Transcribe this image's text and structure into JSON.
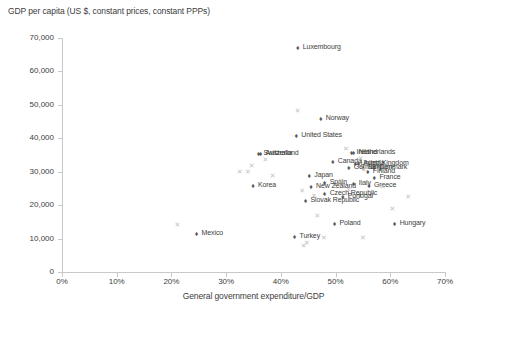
{
  "chart_data": {
    "type": "scatter",
    "title": "GDP per capita (US $, constant prices, constant PPPs)",
    "xlabel": "General government expenditure/GDP",
    "ylabel": "",
    "xlim": [
      0,
      70
    ],
    "ylim": [
      0,
      70000
    ],
    "xticks": [
      "0%",
      "10%",
      "20%",
      "30%",
      "40%",
      "50%",
      "60%",
      "70%"
    ],
    "xtick_values": [
      0,
      10,
      20,
      30,
      40,
      50,
      60,
      70
    ],
    "yticks": [
      "0",
      "10,000",
      "20,000",
      "30,000",
      "40,000",
      "50,000",
      "60,000",
      "70,000"
    ],
    "ytick_values": [
      0,
      10000,
      20000,
      30000,
      40000,
      50000,
      60000,
      70000
    ],
    "grid": false,
    "legend": "none",
    "series": [
      {
        "name": "labelled-countries",
        "marker": "diamond",
        "color": "#58595b",
        "points": [
          {
            "label": "Luxembourg",
            "x": 43.1,
            "y": 67100
          },
          {
            "label": "Norway",
            "x": 47.3,
            "y": 45800
          },
          {
            "label": "United States",
            "x": 42.8,
            "y": 40700
          },
          {
            "label": "Switzerland",
            "x": 35.9,
            "y": 35200
          },
          {
            "label": "Australia",
            "x": 36.3,
            "y": 35200
          },
          {
            "label": "Ireland",
            "x": 52.9,
            "y": 35700
          },
          {
            "label": "Netherlands",
            "x": 53.3,
            "y": 35700
          },
          {
            "label": "Canada",
            "x": 49.5,
            "y": 32800
          },
          {
            "label": "United Kingdom",
            "x": 53.6,
            "y": 32400
          },
          {
            "label": "Austria",
            "x": 54.2,
            "y": 32400
          },
          {
            "label": "Germany",
            "x": 52.4,
            "y": 31100
          },
          {
            "label": "Belgium",
            "x": 55.0,
            "y": 31100
          },
          {
            "label": "Denmark",
            "x": 57.1,
            "y": 31100
          },
          {
            "label": "Finland",
            "x": 55.9,
            "y": 29900
          },
          {
            "label": "France",
            "x": 57.1,
            "y": 28000
          },
          {
            "label": "Japan",
            "x": 45.2,
            "y": 28800
          },
          {
            "label": "Spain",
            "x": 48.0,
            "y": 26700
          },
          {
            "label": "Italy",
            "x": 53.3,
            "y": 26400
          },
          {
            "label": "Greece",
            "x": 56.1,
            "y": 25700
          },
          {
            "label": "New Zealand",
            "x": 45.5,
            "y": 25400
          },
          {
            "label": "Czech Republic",
            "x": 48.0,
            "y": 23400
          },
          {
            "label": "Portugal",
            "x": 51.3,
            "y": 22400
          },
          {
            "label": "Slovak Republic",
            "x": 44.5,
            "y": 21200
          },
          {
            "label": "Poland",
            "x": 49.8,
            "y": 14400
          },
          {
            "label": "Hungary",
            "x": 60.8,
            "y": 14400
          },
          {
            "label": "Korea",
            "x": 34.9,
            "y": 25700
          },
          {
            "label": "Mexico",
            "x": 24.6,
            "y": 11500
          },
          {
            "label": "Turkey",
            "x": 42.5,
            "y": 10600
          }
        ]
      },
      {
        "name": "unlabelled-series",
        "marker": "x",
        "color": "#c2c2c2",
        "points": [
          {
            "x": 43.1,
            "y": 48200
          },
          {
            "x": 37.2,
            "y": 33400
          },
          {
            "x": 34.7,
            "y": 31700
          },
          {
            "x": 32.5,
            "y": 29900
          },
          {
            "x": 34.0,
            "y": 29900
          },
          {
            "x": 38.5,
            "y": 28800
          },
          {
            "x": 51.9,
            "y": 36900
          },
          {
            "x": 54.6,
            "y": 33700
          },
          {
            "x": 55.2,
            "y": 30500
          },
          {
            "x": 57.7,
            "y": 30500
          },
          {
            "x": 51.0,
            "y": 27300
          },
          {
            "x": 54.9,
            "y": 26700
          },
          {
            "x": 58.6,
            "y": 25400
          },
          {
            "x": 43.9,
            "y": 24200
          },
          {
            "x": 52.4,
            "y": 24500
          },
          {
            "x": 46.1,
            "y": 22700
          },
          {
            "x": 63.3,
            "y": 22400
          },
          {
            "x": 60.4,
            "y": 18800
          },
          {
            "x": 46.7,
            "y": 16800
          },
          {
            "x": 21.1,
            "y": 14100
          },
          {
            "x": 47.9,
            "y": 10300
          },
          {
            "x": 55.0,
            "y": 10300
          },
          {
            "x": 44.8,
            "y": 8800
          },
          {
            "x": 44.2,
            "y": 7700
          }
        ]
      }
    ]
  },
  "caption": ""
}
